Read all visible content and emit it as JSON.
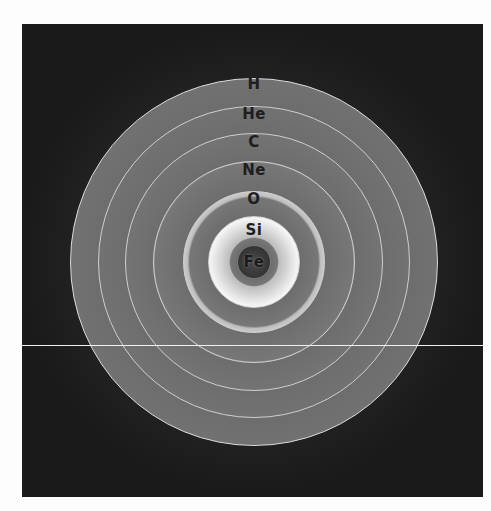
{
  "diagram": {
    "layers": [
      {
        "label": "H",
        "shade": "#e8e8e8",
        "edge": "#9a9a9a"
      },
      {
        "label": "He",
        "shade": "#ececec",
        "edge": "#a0a0a0"
      },
      {
        "label": "C",
        "shade": "#eeeeee",
        "edge": "#a0a0a0"
      },
      {
        "label": "Ne",
        "shade": "#eaeaea",
        "edge": "#909090"
      },
      {
        "label": "O",
        "shade": "#dcdcdc",
        "edge": "#6a6a6a"
      },
      {
        "label": "Si",
        "shade": "#d6d6d6",
        "edge": "#5a5a5a"
      },
      {
        "label": "Fe",
        "shade": "#3a3a3a",
        "edge": "#2a2a2a"
      }
    ],
    "background": "#1c1c1c"
  }
}
